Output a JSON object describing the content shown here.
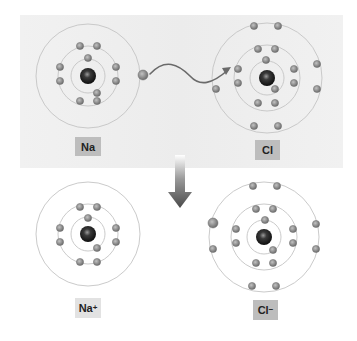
{
  "diagram": {
    "type": "ionic-bond-formation",
    "colors": {
      "top_panel": "#efefef",
      "ring": "#c4c4c4",
      "electron": "#8f8f8f",
      "electron_edge": "#6f6f6f",
      "nucleus": "#1a1a1a",
      "label_box_dark": "#bdbdbd",
      "label_box_light": "#e2e2e2",
      "arrow": "#555555"
    },
    "atoms": [
      {
        "id": "na",
        "label": "Na",
        "charge": "",
        "center": [
          88,
          76
        ],
        "rings": [
          17,
          30,
          52
        ],
        "electrons": [
          [
            88,
            58
          ],
          [
            97,
            93
          ],
          [
            80,
            46
          ],
          [
            97,
            46
          ],
          [
            60,
            67
          ],
          [
            60,
            81
          ],
          [
            116,
            67
          ],
          [
            116,
            81
          ],
          [
            80,
            101
          ],
          [
            97,
            101
          ]
        ],
        "valence_electrons": [
          [
            143,
            75
          ]
        ],
        "label_pos": [
          75,
          137,
          26,
          19
        ],
        "label_style": "dark"
      },
      {
        "id": "cl",
        "label": "Cl",
        "charge": "",
        "center": [
          267,
          78
        ],
        "rings": [
          17,
          33,
          55
        ],
        "electrons": [
          [
            266,
            60
          ],
          [
            275,
            89
          ],
          [
            258,
            49
          ],
          [
            275,
            49
          ],
          [
            238,
            69
          ],
          [
            238,
            83
          ],
          [
            294,
            69
          ],
          [
            294,
            83
          ],
          [
            258,
            103
          ],
          [
            275,
            103
          ],
          [
            254,
            26
          ],
          [
            278,
            26
          ],
          [
            216,
            89
          ],
          [
            317,
            64
          ],
          [
            317,
            89
          ],
          [
            254,
            126
          ],
          [
            278,
            126
          ]
        ],
        "valence_electrons": [],
        "label_pos": [
          255,
          140,
          25,
          20
        ],
        "label_style": "dark"
      },
      {
        "id": "na-ion",
        "label": "Na",
        "charge": "+",
        "center": [
          88,
          234
        ],
        "rings": [
          17,
          30,
          52
        ],
        "electrons": [
          [
            88,
            218
          ],
          [
            97,
            248
          ],
          [
            80,
            207
          ],
          [
            97,
            207
          ],
          [
            60,
            228
          ],
          [
            60,
            242
          ],
          [
            116,
            228
          ],
          [
            116,
            242
          ],
          [
            80,
            262
          ],
          [
            97,
            262
          ]
        ],
        "valence_electrons": [],
        "label_pos": [
          75,
          298,
          26,
          20
        ],
        "label_style": "light"
      },
      {
        "id": "cl-ion",
        "label": "Cl",
        "charge": "−",
        "center": [
          264,
          237
        ],
        "rings": [
          17,
          33,
          55
        ],
        "electrons": [
          [
            265,
            220
          ],
          [
            273,
            250
          ],
          [
            256,
            209
          ],
          [
            273,
            209
          ],
          [
            236,
            229
          ],
          [
            236,
            243
          ],
          [
            293,
            229
          ],
          [
            293,
            243
          ],
          [
            256,
            263
          ],
          [
            273,
            263
          ],
          [
            253,
            186
          ],
          [
            277,
            186
          ],
          [
            213,
            249
          ],
          [
            316,
            224
          ],
          [
            316,
            249
          ],
          [
            252,
            286
          ],
          [
            276,
            286
          ]
        ],
        "valence_electrons": [
          [
            213,
            223
          ]
        ],
        "label_pos": [
          253,
          300,
          25,
          20
        ],
        "label_style": "dark"
      }
    ],
    "transfer_arrow": {
      "label": "electron transfer",
      "path": "M150 74 C 165 58, 178 64, 190 76 C 200 87, 212 84, 228 70"
    },
    "reaction_arrow": {
      "label": "reaction",
      "x": 180,
      "y_top": 155,
      "y_bottom": 208
    },
    "top_panel": {
      "x": 20,
      "y": 15,
      "w": 323,
      "h": 153
    }
  }
}
